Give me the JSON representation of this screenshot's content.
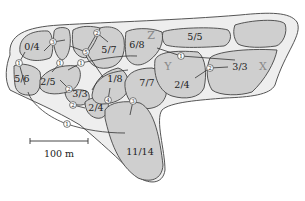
{
  "territories": [
    {
      "id": "t1",
      "label": "0/4",
      "x": 32,
      "y": 50
    },
    {
      "id": "t2",
      "label": "5/6",
      "x": 22,
      "y": 82
    },
    {
      "id": "t3",
      "label": "2/5",
      "x": 48,
      "y": 85
    },
    {
      "id": "t4",
      "label": "3/3",
      "x": 80,
      "y": 97
    },
    {
      "id": "t5",
      "label": "2/4",
      "x": 96,
      "y": 111
    },
    {
      "id": "t6",
      "label": "5/7",
      "x": 109,
      "y": 53
    },
    {
      "id": "t7",
      "label": "1/8",
      "x": 115,
      "y": 82
    },
    {
      "id": "t8",
      "label": "6/8",
      "x": 137,
      "y": 48
    },
    {
      "id": "t9",
      "label": "7/7",
      "x": 147,
      "y": 86
    },
    {
      "id": "t10",
      "label": "11/14",
      "x": 136,
      "y": 155
    },
    {
      "id": "t11",
      "label": "5/5",
      "x": 192,
      "y": 40
    },
    {
      "id": "t12",
      "label": "2/4",
      "x": 188,
      "y": 88
    },
    {
      "id": "t13",
      "label": "3/3",
      "x": 243,
      "y": 70
    }
  ],
  "zones": [
    {
      "label": "Z",
      "x": 151,
      "y": 39
    },
    {
      "label": "Y",
      "x": 168,
      "y": 70
    },
    {
      "label": "X",
      "x": 263,
      "y": 70
    }
  ],
  "nodes": [
    {
      "n": "1",
      "x": 19,
      "y": 63
    },
    {
      "n": "3",
      "x": 53,
      "y": 42
    },
    {
      "n": "1",
      "x": 60,
      "y": 63
    },
    {
      "n": "1",
      "x": 81,
      "y": 63
    },
    {
      "n": "5",
      "x": 86,
      "y": 52
    },
    {
      "n": "2",
      "x": 97,
      "y": 33
    },
    {
      "n": "2",
      "x": 69,
      "y": 89
    },
    {
      "n": "2",
      "x": 73,
      "y": 105
    },
    {
      "n": "4",
      "x": 108,
      "y": 100
    },
    {
      "n": "3",
      "x": 133,
      "y": 101
    },
    {
      "n": "1",
      "x": 67,
      "y": 124
    },
    {
      "n": "1",
      "x": 181,
      "y": 56
    },
    {
      "n": "2",
      "x": 210,
      "y": 68
    }
  ],
  "scale_bar": {
    "label": "100 m"
  }
}
